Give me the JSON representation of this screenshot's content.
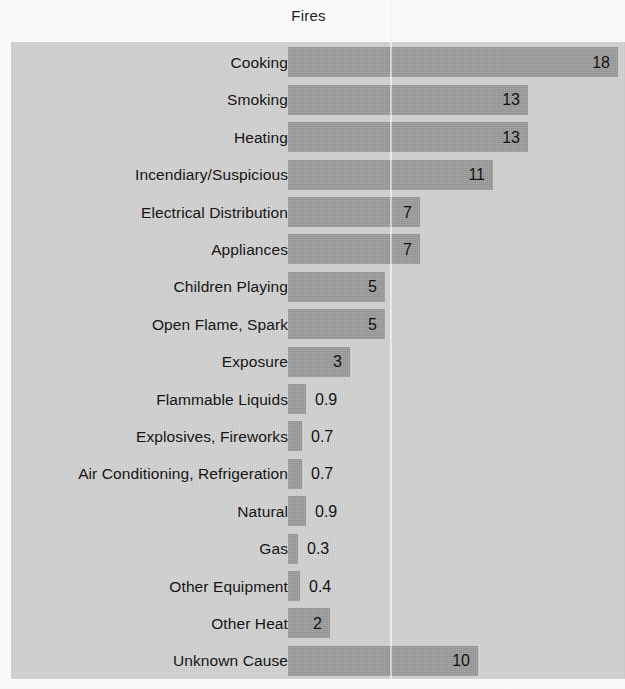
{
  "chart_data": {
    "type": "bar",
    "orientation": "horizontal",
    "title": "Fires",
    "xlabel": "",
    "ylabel": "",
    "grid": false,
    "legend": null,
    "xlim": [
      0,
      18.1
    ],
    "value_unit": "percent",
    "categories": [
      "Cooking",
      "Smoking",
      "Heating",
      "Incendiary/Suspicious",
      "Electrical Distribution",
      "Appliances",
      "Children Playing",
      "Open Flame, Spark",
      "Exposure",
      "Flammable Liquids",
      "Explosives, Fireworks",
      "Air Conditioning, Refrigeration",
      "Natural",
      "Gas",
      "Other Equipment",
      "Other Heat",
      "Unknown Cause"
    ],
    "values": [
      18,
      13,
      13,
      11,
      7,
      7,
      5,
      5,
      3,
      0.9,
      0.7,
      0.7,
      0.9,
      0.3,
      0.4,
      2,
      10
    ],
    "value_labels": [
      "18",
      "13",
      "13",
      "11",
      "7",
      "7",
      "5",
      "5",
      "3",
      "0.9",
      "0.7",
      "0.7",
      "0.9",
      "0.3",
      "0.4",
      "2",
      "10"
    ],
    "label_placement": [
      "inside",
      "inside",
      "inside",
      "inside",
      "inside",
      "inside",
      "inside",
      "inside",
      "inside",
      "outside",
      "outside",
      "outside",
      "outside",
      "outside",
      "outside",
      "inside",
      "inside"
    ],
    "bar_pixel_lengths": [
      330,
      240,
      240,
      205,
      132,
      132,
      97,
      97,
      62,
      18,
      14,
      14,
      18,
      10,
      12,
      42,
      190
    ]
  },
  "colors": {
    "plot_background": "#d6d6d6",
    "bar_fill": "#9d9d9d",
    "text": "#151515",
    "page_background": "#fdfdfd"
  }
}
